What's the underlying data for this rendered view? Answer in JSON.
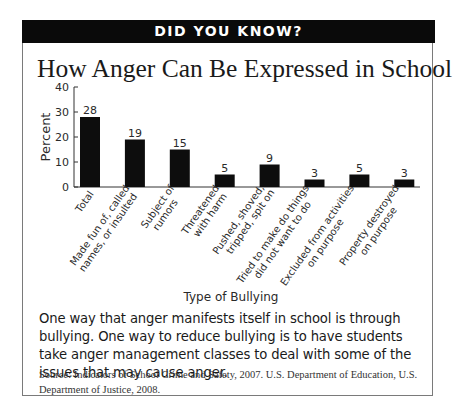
{
  "banner": "DID YOU KNOW?",
  "title": "How Anger Can Be Expressed in School",
  "caption": "One way that anger manifests itself in school is through bullying. One way to reduce bullying is to have students take anger management classes to deal with some of the issues that may cause anger.",
  "source": "Source: Indicators of School Crime and Safety, 2007. U.S. Department of Education, U.S. Department of Justice, 2008.",
  "colors": {
    "bar": "#0d0d0d",
    "banner": "#0a0a0a",
    "border": "#7a7a7a"
  },
  "chart_data": {
    "type": "bar",
    "title": "How Anger Can Be Expressed in School",
    "xlabel": "Type of Bullying",
    "ylabel": "Percent",
    "ylim": [
      0,
      40
    ],
    "yticks": [
      0,
      10,
      20,
      30,
      40
    ],
    "grid": false,
    "legend": null,
    "categories": [
      "Total",
      "Made fun of, called names, or insulted",
      "Subject of rumors",
      "Threatened with harm",
      "Pushed, shoved, tripped, spit on",
      "Tried to make do things did not want to do",
      "Excluded from activities on purpose",
      "Property destroyed on purpose"
    ],
    "category_lines": [
      [
        "Total"
      ],
      [
        "Made fun of, called",
        "names, or insulted"
      ],
      [
        "Subject of",
        "rumors"
      ],
      [
        "Threatened",
        "with harm"
      ],
      [
        "Pushed, shoved,",
        "tripped, spit on"
      ],
      [
        "Tried to make do things",
        "did not want to do"
      ],
      [
        "Excluded from activities",
        "on purpose"
      ],
      [
        "Property destroyed",
        "on purpose"
      ]
    ],
    "values": [
      28,
      19,
      15,
      5,
      9,
      3,
      5,
      3
    ],
    "data_labels": [
      "28",
      "19",
      "15",
      "5",
      "9",
      "3",
      "5",
      "3"
    ]
  }
}
